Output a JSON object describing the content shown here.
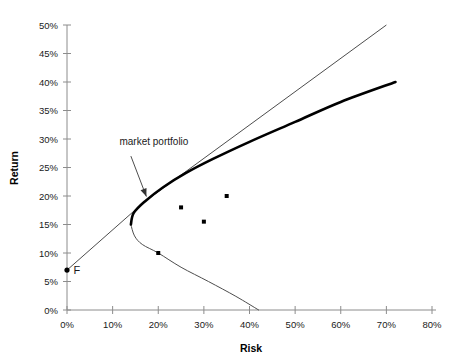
{
  "chart_data": {
    "type": "scatter",
    "title": "",
    "xlabel": "Risk",
    "ylabel": "Return",
    "xlim": [
      0,
      80
    ],
    "ylim": [
      0,
      50
    ],
    "xtick_labels": [
      "0%",
      "10%",
      "20%",
      "30%",
      "40%",
      "50%",
      "60%",
      "70%",
      "80%"
    ],
    "xticks": [
      0,
      10,
      20,
      30,
      40,
      50,
      60,
      70,
      80
    ],
    "ytick_labels": [
      "0%",
      "5%",
      "10%",
      "15%",
      "20%",
      "25%",
      "30%",
      "35%",
      "40%",
      "45%",
      "50%"
    ],
    "yticks": [
      0,
      5,
      10,
      15,
      20,
      25,
      30,
      35,
      40,
      45,
      50
    ],
    "grid": false,
    "legend": "none",
    "series": [
      {
        "name": "individual assets",
        "type": "scatter",
        "points": [
          {
            "x": 25.0,
            "y": 18.0
          },
          {
            "x": 30.0,
            "y": 15.5
          },
          {
            "x": 35.0,
            "y": 20.0
          },
          {
            "x": 20.0,
            "y": 10.0
          }
        ]
      },
      {
        "name": "risk-free asset",
        "type": "scatter",
        "points": [
          {
            "x": 0.0,
            "y": 7.0
          }
        ]
      },
      {
        "name": "capital market line",
        "type": "line",
        "style": "thin",
        "points": [
          {
            "x": 0.0,
            "y": 7.0
          },
          {
            "x": 17.0,
            "y": 19.0
          },
          {
            "x": 70.0,
            "y": 50.0
          }
        ]
      },
      {
        "name": "efficient frontier (upper branch)",
        "type": "curve",
        "style": "thick",
        "points": [
          {
            "x": 14.0,
            "y": 15.0
          },
          {
            "x": 14.6,
            "y": 17.0
          },
          {
            "x": 17.0,
            "y": 19.0
          },
          {
            "x": 21.0,
            "y": 21.5
          },
          {
            "x": 26.0,
            "y": 24.0
          },
          {
            "x": 32.0,
            "y": 26.5
          },
          {
            "x": 40.0,
            "y": 29.5
          },
          {
            "x": 50.0,
            "y": 33.0
          },
          {
            "x": 60.0,
            "y": 36.5
          },
          {
            "x": 72.0,
            "y": 40.0
          }
        ]
      },
      {
        "name": "inefficient frontier (lower branch)",
        "type": "curve",
        "style": "thin",
        "points": [
          {
            "x": 14.0,
            "y": 15.0
          },
          {
            "x": 14.8,
            "y": 13.0
          },
          {
            "x": 16.5,
            "y": 11.5
          },
          {
            "x": 20.0,
            "y": 10.0
          },
          {
            "x": 25.0,
            "y": 7.5
          },
          {
            "x": 31.0,
            "y": 5.0
          },
          {
            "x": 37.0,
            "y": 2.4
          },
          {
            "x": 42.0,
            "y": 0.0
          }
        ]
      }
    ],
    "annotations": [
      {
        "name": "market-portfolio",
        "text": "market portfolio",
        "text_x": 11.5,
        "text_y": 29.0,
        "arrow_from_x": 14.0,
        "arrow_from_y": 27.0,
        "arrow_to_x": 17.4,
        "arrow_to_y": 19.9
      },
      {
        "name": "risk-free-point",
        "text": "F",
        "text_x": 1.4,
        "text_y": 7.0
      }
    ]
  },
  "style": {
    "axis_color": "#8c8c8c",
    "tick_color": "#8c8c8c",
    "curve_thick_color": "#000000",
    "curve_thin_color": "#4d4d4d",
    "point_color": "#000000",
    "text_color": "#1a1a1a",
    "background": "#ffffff"
  }
}
